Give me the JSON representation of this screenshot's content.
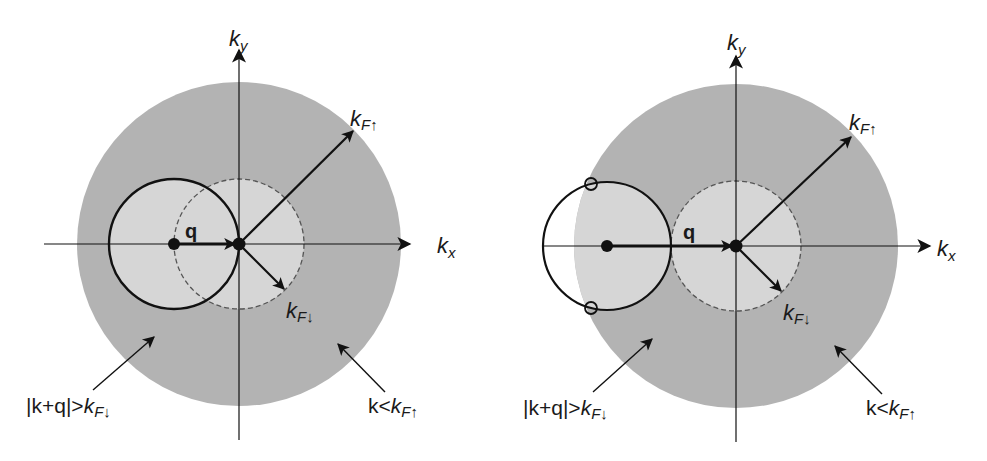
{
  "colors": {
    "background": "#ffffff",
    "outer_sphere": "#b3b3b3",
    "inner_sphere": "#d6d6d6",
    "line": "#111111",
    "dashed": "#555555"
  },
  "panels": [
    {
      "id": "left",
      "axis_x_label": "k",
      "axis_x_sub": "x",
      "axis_y_label": "k",
      "axis_y_sub": "y",
      "vector_q_label": "q",
      "kf_up_label": "k",
      "kf_up_sub": "F↑",
      "kf_down_label": "k",
      "kf_down_sub": "F↓",
      "annotation_left_text": "|k+q|>",
      "annotation_left_k": "k",
      "annotation_left_sub": "F↓",
      "annotation_right_text": "k<",
      "annotation_right_k": "k",
      "annotation_right_sub": "F↑"
    },
    {
      "id": "right",
      "axis_x_label": "k",
      "axis_x_sub": "x",
      "axis_y_label": "k",
      "axis_y_sub": "y",
      "vector_q_label": "q",
      "kf_up_label": "k",
      "kf_up_sub": "F↑",
      "kf_down_label": "k",
      "kf_down_sub": "F↓",
      "annotation_left_text": "|k+q|>",
      "annotation_left_k": "k",
      "annotation_left_sub": "F↓",
      "annotation_right_text": "k<",
      "annotation_right_k": "k",
      "annotation_right_sub": "F↑"
    }
  ]
}
